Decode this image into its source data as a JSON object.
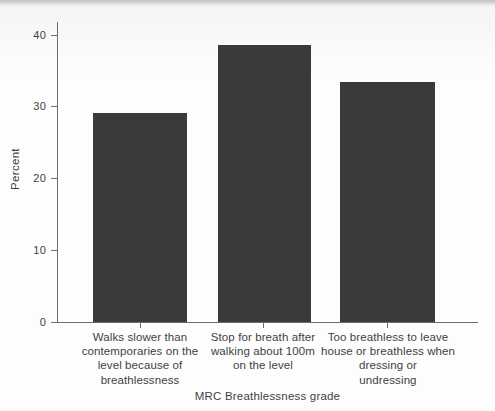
{
  "chart_data": {
    "type": "bar",
    "title": "",
    "subtitle": "",
    "xlabel": "MRC Breathlessness grade",
    "ylabel": "Percent",
    "categories": [
      "Walks slower than contemporaries on the level because of breathlessness",
      "Stop for breath after walking about 100m on the level",
      "Too breathless to leave house or breathless when dressing or undressing"
    ],
    "category_lines": [
      [
        "Walks slower than",
        "contemporaries on the",
        "level because of",
        "breathlessness"
      ],
      [
        "Stop for breath after",
        "walking about 100m",
        "on the level"
      ],
      [
        "Too breathless to leave",
        "house or breathless when",
        "dressing or",
        "undressing"
      ]
    ],
    "values": [
      29.1,
      38.6,
      33.4
    ],
    "ylim": [
      0,
      42
    ],
    "yticks": [
      0,
      10,
      20,
      30,
      40
    ],
    "ytick_labels": [
      "0",
      "10",
      "20",
      "30",
      "40"
    ],
    "grid": false,
    "legend": false,
    "legend_position": "none",
    "bar_color": "#3a3a3a",
    "axis_color": "#6d6d6d",
    "text_color": "#3f3f3f",
    "background_color": "#fdfdfd"
  }
}
